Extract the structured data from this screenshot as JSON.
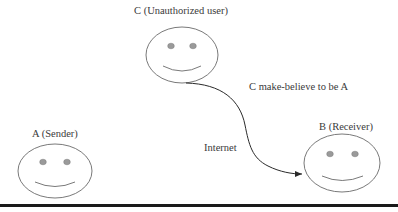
{
  "diagram": {
    "title": "",
    "nodes": [
      {
        "id": "C",
        "label": "C (Unauthorized user)",
        "role": "unauthorized-user",
        "icon": "smiley-face-icon"
      },
      {
        "id": "A",
        "label": "A (Sender)",
        "role": "sender",
        "icon": "smiley-face-icon"
      },
      {
        "id": "B",
        "label": "B (Receiver)",
        "role": "receiver",
        "icon": "smiley-face-icon"
      }
    ],
    "edges": [
      {
        "from": "C",
        "to": "B",
        "label": "C make-believe to be A",
        "style": "curved-arrow"
      }
    ],
    "annotations": [
      {
        "text": "Internet"
      }
    ]
  },
  "colors": {
    "stroke": "#6a6a6a",
    "eye_fill": "#9a9a9a",
    "text": "#3a3a3a",
    "arrow": "#2a2a2a",
    "rule": "#1a1a1a"
  }
}
